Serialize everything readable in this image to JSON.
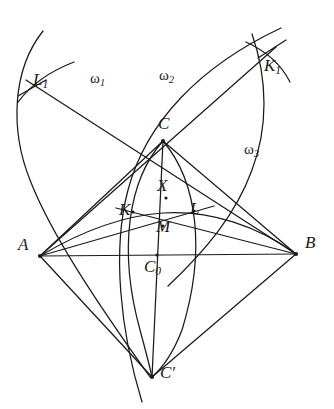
{
  "figure": {
    "background_color": "#ffffff",
    "stroke_color": "#1a1a1a",
    "width": 334,
    "height": 409
  },
  "labels": {
    "A": "A",
    "B": "B",
    "C": "C",
    "C_prime": "C′",
    "C_zero_main": "C",
    "C_zero_sub": "0",
    "X": "X",
    "M": "M",
    "K": "K",
    "L": "L",
    "K1_main": "K",
    "K1_sub": "1",
    "L1_main": "L",
    "L1_sub": "1",
    "omega1_main": "ω",
    "omega1_sub": "1",
    "omega2_main": "ω",
    "omega2_sub": "2",
    "omega3_main": "ω",
    "omega3_sub": "3"
  },
  "points": {
    "A": {
      "x": 40,
      "y": 256
    },
    "B": {
      "x": 296,
      "y": 254
    },
    "C": {
      "x": 163,
      "y": 141
    },
    "C_prime": {
      "x": 152,
      "y": 377
    },
    "C_zero": {
      "x": 157,
      "y": 255
    },
    "X": {
      "x": 166,
      "y": 198
    },
    "M": {
      "x": 163,
      "y": 226
    },
    "K": {
      "x": 133,
      "y": 212
    },
    "L": {
      "x": 194,
      "y": 211
    },
    "K1": {
      "x": 268,
      "y": 58
    },
    "L1": {
      "x": 32,
      "y": 88
    }
  },
  "label_positions": {
    "A": {
      "x": 18,
      "y": 236
    },
    "B": {
      "x": 305,
      "y": 234
    },
    "C": {
      "x": 160,
      "y": 117
    },
    "C_prime": {
      "x": 160,
      "y": 366
    },
    "C_zero": {
      "x": 147,
      "y": 259
    },
    "X": {
      "x": 158,
      "y": 177
    },
    "M": {
      "x": 157,
      "y": 220
    },
    "K": {
      "x": 120,
      "y": 203
    },
    "L": {
      "x": 191,
      "y": 202
    },
    "K1": {
      "x": 266,
      "y": 58
    },
    "L1": {
      "x": 35,
      "y": 72
    },
    "omega1": {
      "x": 92,
      "y": 72
    },
    "omega2": {
      "x": 161,
      "y": 69
    },
    "omega3": {
      "x": 246,
      "y": 143
    }
  },
  "arcs": [
    {
      "name": "omega1",
      "label": "ω1",
      "description": "arc through L1, C, C-prime region on the left"
    },
    {
      "name": "omega2",
      "label": "ω2",
      "description": "arc through C and K1 upward to the right"
    },
    {
      "name": "omega3",
      "label": "ω3",
      "description": "arc on the right near B"
    }
  ],
  "segments": [
    {
      "from": "A",
      "to": "B"
    },
    {
      "from": "A",
      "to": "C"
    },
    {
      "from": "B",
      "to": "C"
    },
    {
      "from": "A",
      "to": "C_prime"
    },
    {
      "from": "B",
      "to": "C_prime"
    },
    {
      "from": "A",
      "to": "L"
    },
    {
      "from": "B",
      "to": "K"
    },
    {
      "from": "C",
      "to": "C_prime"
    },
    {
      "from": "A",
      "to": "K1"
    },
    {
      "from": "B",
      "to": "L1"
    }
  ]
}
